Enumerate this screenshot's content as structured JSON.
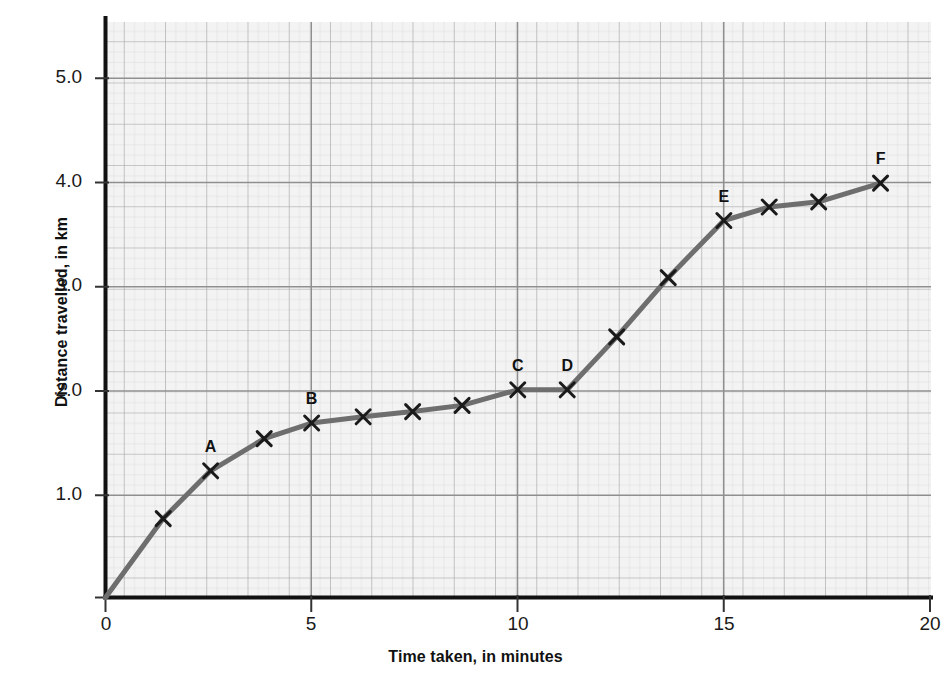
{
  "chart_data": {
    "type": "line",
    "title": "",
    "xlabel": "Time taken, in minutes",
    "ylabel": "Distance travelled, in km",
    "xlim": [
      0,
      20
    ],
    "ylim": [
      0,
      5.5
    ],
    "xticks": [
      "0",
      "5",
      "10",
      "15",
      "20"
    ],
    "xtick_values": [
      0,
      5,
      10,
      15,
      20
    ],
    "yticks": [
      "1.0",
      "2.0",
      "3.0",
      "4.0",
      "5.0"
    ],
    "ytick_values": [
      1.0,
      2.0,
      3.0,
      4.0,
      5.0
    ],
    "grid": "graph-paper: major 1 minute by 0.25 km, minor subdivisions",
    "legend": "none",
    "line_color": "#6e6e6e",
    "marker_style": "x-cross",
    "marker_color": "#1a1a1a",
    "series": [
      {
        "name": "Journey",
        "x": [
          0,
          1.4,
          2.55,
          3.85,
          5.0,
          6.25,
          7.45,
          8.65,
          10.0,
          11.2,
          12.4,
          13.65,
          15.0,
          16.1,
          17.3,
          18.8
        ],
        "y": [
          0,
          0.76,
          1.22,
          1.53,
          1.68,
          1.74,
          1.79,
          1.85,
          2.0,
          2.0,
          2.51,
          3.08,
          3.63,
          3.76,
          3.81,
          3.99
        ],
        "point_labels": [
          "",
          "",
          "A",
          "",
          "B",
          "",
          "",
          "",
          "C",
          "D",
          "",
          "",
          "E",
          "",
          "",
          "F"
        ]
      }
    ],
    "labelled_points": [
      {
        "label": "A",
        "x": 2.55,
        "y": 1.22
      },
      {
        "label": "B",
        "x": 5.0,
        "y": 1.68
      },
      {
        "label": "C",
        "x": 10.0,
        "y": 2.0
      },
      {
        "label": "D",
        "x": 11.2,
        "y": 2.0
      },
      {
        "label": "E",
        "x": 15.0,
        "y": 3.63
      },
      {
        "label": "F",
        "x": 18.8,
        "y": 3.99
      }
    ]
  },
  "colors": {
    "plot_background": "#f2f2f2",
    "grid_major": "#a8a8a8",
    "grid_minor": "#cfcfcf",
    "axis": "#111111",
    "line": "#6e6e6e"
  }
}
